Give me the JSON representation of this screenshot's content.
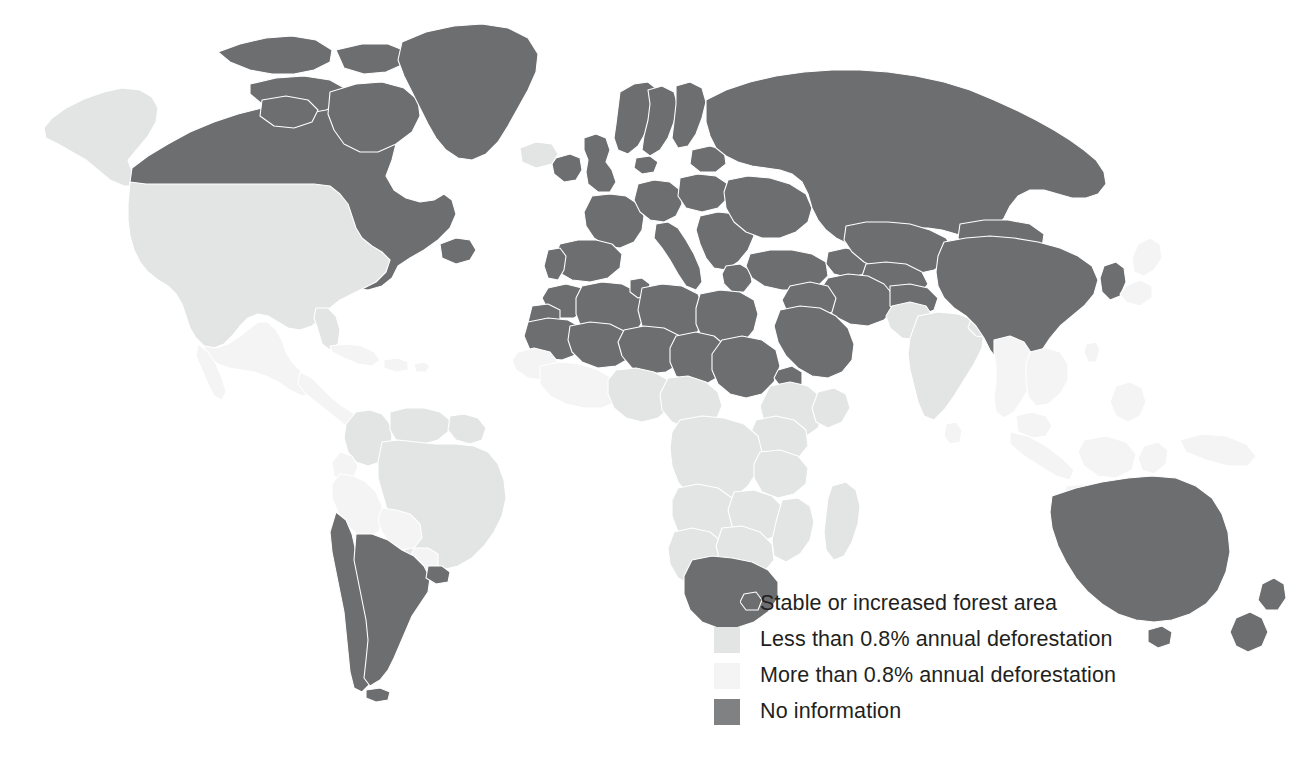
{
  "figure": {
    "kind": "choropleth-world-map",
    "background_color": "#ffffff",
    "border_color": "#ffffff"
  },
  "legend": {
    "position": "bottom-center-right",
    "items": [
      {
        "label": "Stable or increased forest area",
        "color": "#6d6e70",
        "swatch_name": "legend-swatch-stable"
      },
      {
        "label": "Less than 0.8% annual deforestation",
        "color": "#e3e4e4",
        "swatch_name": "legend-swatch-less-than"
      },
      {
        "label": "More than 0.8% annual deforestation",
        "color": "#f4f4f4",
        "swatch_name": "legend-swatch-more-than"
      },
      {
        "label": "No information",
        "color": "#808183",
        "swatch_name": "legend-swatch-no-info"
      }
    ]
  },
  "map_data": {
    "type": "choropleth",
    "projection": "equirectangular-like",
    "categories": [
      "Stable or increased forest area",
      "Less than 0.8% annual deforestation",
      "More than 0.8% annual deforestation",
      "No information"
    ],
    "category_colors": [
      "#6d6e70",
      "#e3e4e4",
      "#f4f4f4",
      "#808183"
    ],
    "regions": [
      {
        "name": "Canada",
        "category": "Stable or increased forest area"
      },
      {
        "name": "Greenland",
        "category": "Stable or increased forest area"
      },
      {
        "name": "United States",
        "category": "Less than 0.8% annual deforestation"
      },
      {
        "name": "Alaska",
        "category": "Less than 0.8% annual deforestation"
      },
      {
        "name": "Mexico",
        "category": "More than 0.8% annual deforestation"
      },
      {
        "name": "Central America",
        "category": "More than 0.8% annual deforestation"
      },
      {
        "name": "Caribbean",
        "category": "More than 0.8% annual deforestation"
      },
      {
        "name": "Colombia",
        "category": "Less than 0.8% annual deforestation"
      },
      {
        "name": "Venezuela",
        "category": "Less than 0.8% annual deforestation"
      },
      {
        "name": "Guyanas",
        "category": "Less than 0.8% annual deforestation"
      },
      {
        "name": "Brazil",
        "category": "Less than 0.8% annual deforestation"
      },
      {
        "name": "Peru",
        "category": "More than 0.8% annual deforestation"
      },
      {
        "name": "Bolivia",
        "category": "More than 0.8% annual deforestation"
      },
      {
        "name": "Ecuador",
        "category": "More than 0.8% annual deforestation"
      },
      {
        "name": "Paraguay",
        "category": "More than 0.8% annual deforestation"
      },
      {
        "name": "Argentina",
        "category": "Stable or increased forest area"
      },
      {
        "name": "Chile",
        "category": "Stable or increased forest area"
      },
      {
        "name": "Uruguay",
        "category": "Stable or increased forest area"
      },
      {
        "name": "United Kingdom",
        "category": "Stable or increased forest area"
      },
      {
        "name": "Ireland",
        "category": "Stable or increased forest area"
      },
      {
        "name": "Iceland",
        "category": "Less than 0.8% annual deforestation"
      },
      {
        "name": "Norway",
        "category": "Stable or increased forest area"
      },
      {
        "name": "Sweden",
        "category": "Stable or increased forest area"
      },
      {
        "name": "Finland",
        "category": "Stable or increased forest area"
      },
      {
        "name": "France",
        "category": "Stable or increased forest area"
      },
      {
        "name": "Spain",
        "category": "Stable or increased forest area"
      },
      {
        "name": "Portugal",
        "category": "Stable or increased forest area"
      },
      {
        "name": "Germany",
        "category": "Stable or increased forest area"
      },
      {
        "name": "Poland",
        "category": "Stable or increased forest area"
      },
      {
        "name": "Italy",
        "category": "Stable or increased forest area"
      },
      {
        "name": "Balkans",
        "category": "Stable or increased forest area"
      },
      {
        "name": "Greece",
        "category": "Stable or increased forest area"
      },
      {
        "name": "Ukraine",
        "category": "Stable or increased forest area"
      },
      {
        "name": "Russia",
        "category": "Stable or increased forest area"
      },
      {
        "name": "Kazakhstan",
        "category": "Stable or increased forest area"
      },
      {
        "name": "Turkey",
        "category": "Stable or increased forest area"
      },
      {
        "name": "Iran",
        "category": "Stable or increased forest area"
      },
      {
        "name": "Iraq",
        "category": "Stable or increased forest area"
      },
      {
        "name": "Saudi Arabia",
        "category": "Stable or increased forest area"
      },
      {
        "name": "Morocco",
        "category": "Stable or increased forest area"
      },
      {
        "name": "Algeria",
        "category": "Stable or increased forest area"
      },
      {
        "name": "Libya",
        "category": "Stable or increased forest area"
      },
      {
        "name": "Egypt",
        "category": "Stable or increased forest area"
      },
      {
        "name": "Tunisia",
        "category": "Stable or increased forest area"
      },
      {
        "name": "Mauritania",
        "category": "Stable or increased forest area"
      },
      {
        "name": "Mali",
        "category": "Stable or increased forest area"
      },
      {
        "name": "Niger",
        "category": "Stable or increased forest area"
      },
      {
        "name": "Chad",
        "category": "Stable or increased forest area"
      },
      {
        "name": "Sudan",
        "category": "Stable or increased forest area"
      },
      {
        "name": "Eritrea",
        "category": "Stable or increased forest area"
      },
      {
        "name": "Western Sahara",
        "category": "Stable or increased forest area"
      },
      {
        "name": "Senegal",
        "category": "More than 0.8% annual deforestation"
      },
      {
        "name": "Guinea",
        "category": "More than 0.8% annual deforestation"
      },
      {
        "name": "Nigeria",
        "category": "Less than 0.8% annual deforestation"
      },
      {
        "name": "Ethiopia",
        "category": "Less than 0.8% annual deforestation"
      },
      {
        "name": "Democratic Republic of the Congo",
        "category": "Less than 0.8% annual deforestation"
      },
      {
        "name": "Angola",
        "category": "Less than 0.8% annual deforestation"
      },
      {
        "name": "Zambia",
        "category": "Less than 0.8% annual deforestation"
      },
      {
        "name": "Tanzania",
        "category": "Less than 0.8% annual deforestation"
      },
      {
        "name": "Kenya",
        "category": "Less than 0.8% annual deforestation"
      },
      {
        "name": "Namibia",
        "category": "Less than 0.8% annual deforestation"
      },
      {
        "name": "Botswana",
        "category": "Less than 0.8% annual deforestation"
      },
      {
        "name": "Zimbabwe",
        "category": "Less than 0.8% annual deforestation"
      },
      {
        "name": "Mozambique",
        "category": "Less than 0.8% annual deforestation"
      },
      {
        "name": "Madagascar",
        "category": "Less than 0.8% annual deforestation"
      },
      {
        "name": "South Africa",
        "category": "Stable or increased forest area"
      },
      {
        "name": "Lesotho",
        "category": "Stable or increased forest area"
      },
      {
        "name": "India",
        "category": "Less than 0.8% annual deforestation"
      },
      {
        "name": "Pakistan",
        "category": "Less than 0.8% annual deforestation"
      },
      {
        "name": "China",
        "category": "Stable or increased forest area"
      },
      {
        "name": "Mongolia",
        "category": "Stable or increased forest area"
      },
      {
        "name": "North Korea",
        "category": "Stable or increased forest area"
      },
      {
        "name": "South Korea",
        "category": "Stable or increased forest area"
      },
      {
        "name": "Japan",
        "category": "More than 0.8% annual deforestation"
      },
      {
        "name": "Southeast Asia",
        "category": "More than 0.8% annual deforestation"
      },
      {
        "name": "Indonesia",
        "category": "More than 0.8% annual deforestation"
      },
      {
        "name": "Philippines",
        "category": "More than 0.8% annual deforestation"
      },
      {
        "name": "Papua New Guinea",
        "category": "More than 0.8% annual deforestation"
      },
      {
        "name": "Australia",
        "category": "Stable or increased forest area"
      },
      {
        "name": "New Zealand",
        "category": "Stable or increased forest area"
      }
    ]
  }
}
